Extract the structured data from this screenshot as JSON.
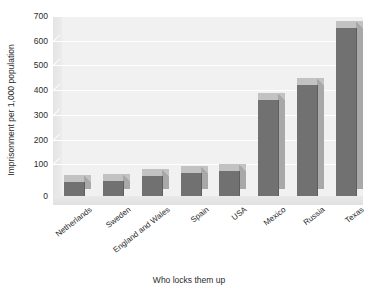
{
  "chart_data": {
    "type": "bar",
    "title": "",
    "xlabel": "Who locks them up",
    "ylabel": "Imprisonment per 1,000 population",
    "categories": [
      "Netherlands",
      "Sweden",
      "England and Wales",
      "Spain",
      "USA",
      "Mexico",
      "Russia",
      "Texas"
    ],
    "values": [
      55,
      60,
      80,
      95,
      100,
      390,
      450,
      680
    ],
    "ylim": [
      0,
      700
    ],
    "yticks": [
      0,
      100,
      200,
      300,
      400,
      500,
      600,
      700
    ],
    "ytick_labels": [
      "0",
      "100",
      "200",
      "300",
      "400",
      "500",
      "600",
      "700"
    ],
    "grid": true,
    "legend": null,
    "style": "3d-bar",
    "colors": {
      "bar_front": "#717171",
      "bar_side": "#a8a8a8",
      "bar_top": "#c2c2c2",
      "plot_background": "#f1f1f1",
      "gridline": "#ffffff",
      "text": "#2b2b2b"
    }
  }
}
